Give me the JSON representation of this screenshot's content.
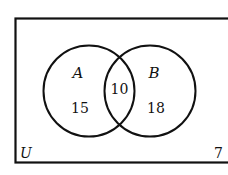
{
  "diagram": {
    "type": "venn",
    "universe": {
      "label": "U",
      "outside_count": "7"
    },
    "sets": [
      {
        "label": "A",
        "only_count": "15"
      },
      {
        "label": "B",
        "only_count": "18"
      }
    ],
    "intersection": {
      "label": "A∩B",
      "count": "10"
    },
    "colors": {
      "stroke": "#111111",
      "background": "#ffffff"
    }
  }
}
